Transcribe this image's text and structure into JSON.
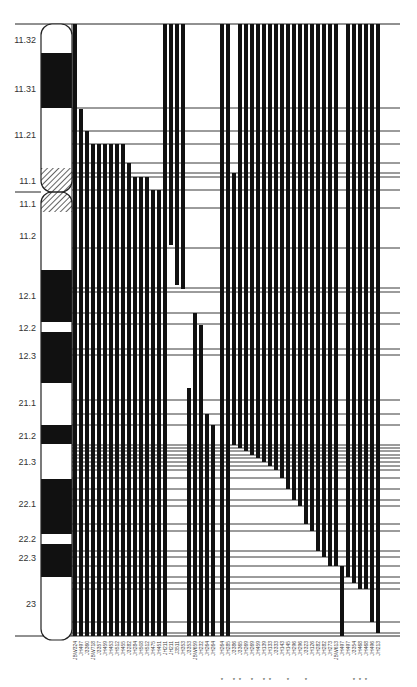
{
  "figure": {
    "title": "",
    "ideogram": {
      "x": 41,
      "width": 31,
      "top": 24,
      "bottom": 640,
      "centromere_y": 192,
      "bands": [
        {
          "label": "11.32",
          "y0": 24,
          "y1": 53,
          "type": "white"
        },
        {
          "label": "11.31",
          "y0": 53,
          "y1": 108,
          "type": "black"
        },
        {
          "label": "11.21",
          "y0": 108,
          "y1": 168,
          "type": "white"
        },
        {
          "label": "11.1",
          "y0": 168,
          "y1": 192,
          "type": "hatched"
        },
        {
          "label": "11.1",
          "y0": 192,
          "y1": 212,
          "type": "hatched"
        },
        {
          "label": "11.2",
          "y0": 212,
          "y1": 270,
          "type": "white"
        },
        {
          "label": "12.1",
          "y0": 270,
          "y1": 322,
          "type": "black"
        },
        {
          "label": "12.2",
          "y0": 322,
          "y1": 332,
          "type": "white"
        },
        {
          "label": "12.3",
          "y0": 332,
          "y1": 383,
          "type": "black"
        },
        {
          "label": "21.1",
          "y0": 383,
          "y1": 425,
          "type": "white"
        },
        {
          "label": "21.2",
          "y0": 425,
          "y1": 444,
          "type": "black"
        },
        {
          "label": "21.3",
          "y0": 444,
          "y1": 479,
          "type": "white"
        },
        {
          "label": "22.1",
          "y0": 479,
          "y1": 534,
          "type": "black"
        },
        {
          "label": "22.2",
          "y0": 534,
          "y1": 544,
          "type": "white"
        },
        {
          "label": "22.3",
          "y0": 544,
          "y1": 577,
          "type": "black"
        },
        {
          "label": "23",
          "y0": 577,
          "y1": 640,
          "type": "white"
        }
      ],
      "label_positions": [
        {
          "label": "11.32",
          "y": 40
        },
        {
          "label": "11.31",
          "y": 89
        },
        {
          "label": "11.21",
          "y": 135
        },
        {
          "label": "11.1",
          "y": 181
        },
        {
          "label": "11.1",
          "y": 204
        },
        {
          "label": "11.2",
          "y": 236
        },
        {
          "label": "12.1",
          "y": 296
        },
        {
          "label": "12.2",
          "y": 328
        },
        {
          "label": "12.3",
          "y": 356
        },
        {
          "label": "21.1",
          "y": 403
        },
        {
          "label": "21.2",
          "y": 436
        },
        {
          "label": "21.3",
          "y": 462
        },
        {
          "label": "22.1",
          "y": 504
        },
        {
          "label": "22.2",
          "y": 539
        },
        {
          "label": "22.3",
          "y": 558
        },
        {
          "label": "23",
          "y": 604
        }
      ]
    },
    "grid": {
      "x_start": 72,
      "x_end": 400,
      "top": 24,
      "bottom": 636,
      "top_line_x0": 15,
      "bottom_line_x0": 15,
      "horizontal_lines": [
        108,
        131,
        144,
        163,
        173,
        177,
        190,
        208,
        248,
        288,
        292,
        313,
        324,
        349,
        355,
        400,
        414,
        425,
        445,
        448,
        451,
        455,
        458,
        462,
        466,
        470,
        478,
        489,
        500,
        506,
        524,
        531,
        551,
        557,
        566,
        577,
        583,
        589,
        622,
        633
      ]
    },
    "chart_data": {
      "type": "deletion-map",
      "xlabel": "",
      "ylabel": "",
      "columns": [
        {
          "name": "JBW324",
          "x": 75,
          "y0": 24,
          "y1": 636,
          "star": false
        },
        {
          "name": "JH497",
          "x": 81,
          "y0": 109,
          "y1": 636,
          "star": false
        },
        {
          "name": "J3360",
          "x": 87,
          "y0": 131,
          "y1": 636,
          "star": false
        },
        {
          "name": "JBW718",
          "x": 93,
          "y0": 144,
          "y1": 636,
          "star": false
        },
        {
          "name": "J3357",
          "x": 99,
          "y0": 144,
          "y1": 636,
          "star": false
        },
        {
          "name": "JH459",
          "x": 105,
          "y0": 144,
          "y1": 636,
          "star": false
        },
        {
          "name": "JH453",
          "x": 111,
          "y0": 144,
          "y1": 636,
          "star": false
        },
        {
          "name": "JH512",
          "x": 117,
          "y0": 144,
          "y1": 636,
          "star": false
        },
        {
          "name": "JH455",
          "x": 123,
          "y0": 144,
          "y1": 636,
          "star": false
        },
        {
          "name": "J3282",
          "x": 129,
          "y0": 163,
          "y1": 636,
          "star": false
        },
        {
          "name": "JH284",
          "x": 135,
          "y0": 177,
          "y1": 636,
          "star": false
        },
        {
          "name": "JH508",
          "x": 141,
          "y0": 177,
          "y1": 636,
          "star": false
        },
        {
          "name": "JH512",
          "x": 147,
          "y0": 177,
          "y1": 636,
          "star": false
        },
        {
          "name": "JH475",
          "x": 153,
          "y0": 190,
          "y1": 636,
          "star": false
        },
        {
          "name": "JH451",
          "x": 159,
          "y0": 190,
          "y1": 636,
          "star": false
        },
        {
          "name": "JH211",
          "x": 165,
          "y0": 24,
          "y1": 636,
          "star": false
        },
        {
          "name": "JH211",
          "x": 171,
          "y0": 24,
          "y1": 245,
          "star": false
        },
        {
          "name": "J3511",
          "x": 177,
          "y0": 24,
          "y1": 285,
          "star": false
        },
        {
          "name": "JH353",
          "x": 183,
          "y0": 24,
          "y1": 289,
          "star": false
        },
        {
          "name": "J3353",
          "x": 189,
          "y0": 388,
          "y1": 636,
          "star": false
        },
        {
          "name": "JBW659",
          "x": 195,
          "y0": 313,
          "y1": 636,
          "star": false
        },
        {
          "name": "JH232",
          "x": 201,
          "y0": 325,
          "y1": 636,
          "star": false
        },
        {
          "name": "JH264",
          "x": 207,
          "y0": 414,
          "y1": 636,
          "star": false
        },
        {
          "name": "JH264",
          "x": 213,
          "y0": 425,
          "y1": 636,
          "star": false
        },
        {
          "name": "JH264",
          "x": 222,
          "y0": 24,
          "y1": 636,
          "star": true
        },
        {
          "name": "JH285",
          "x": 228,
          "y0": 24,
          "y1": 636,
          "star": false
        },
        {
          "name": "J3386",
          "x": 234,
          "y0": 173,
          "y1": 445,
          "star": true
        },
        {
          "name": "J3365",
          "x": 240,
          "y0": 24,
          "y1": 448,
          "star": true
        },
        {
          "name": "JH269",
          "x": 246,
          "y0": 24,
          "y1": 451,
          "star": false
        },
        {
          "name": "JH269",
          "x": 252,
          "y0": 24,
          "y1": 455,
          "star": true
        },
        {
          "name": "JH459",
          "x": 258,
          "y0": 24,
          "y1": 458,
          "star": false
        },
        {
          "name": "JH139",
          "x": 264,
          "y0": 24,
          "y1": 462,
          "star": true
        },
        {
          "name": "JH133",
          "x": 270,
          "y0": 24,
          "y1": 466,
          "star": true
        },
        {
          "name": "J3333",
          "x": 276,
          "y0": 24,
          "y1": 470,
          "star": false
        },
        {
          "name": "JH143",
          "x": 282,
          "y0": 24,
          "y1": 478,
          "star": false
        },
        {
          "name": "JH145",
          "x": 288,
          "y0": 24,
          "y1": 489,
          "star": true
        },
        {
          "name": "JH296",
          "x": 294,
          "y0": 24,
          "y1": 500,
          "star": false
        },
        {
          "name": "JH296",
          "x": 300,
          "y0": 24,
          "y1": 506,
          "star": false
        },
        {
          "name": "J3323",
          "x": 306,
          "y0": 24,
          "y1": 524,
          "star": true
        },
        {
          "name": "JH126",
          "x": 312,
          "y0": 24,
          "y1": 531,
          "star": false
        },
        {
          "name": "JH282",
          "x": 318,
          "y0": 24,
          "y1": 551,
          "star": false
        },
        {
          "name": "JH282",
          "x": 324,
          "y0": 24,
          "y1": 557,
          "star": false
        },
        {
          "name": "JH273",
          "x": 330,
          "y0": 24,
          "y1": 566,
          "star": false
        },
        {
          "name": "JBW613",
          "x": 336,
          "y0": 24,
          "y1": 566,
          "star": false
        },
        {
          "name": "JH497",
          "x": 342,
          "y0": 566,
          "y1": 636,
          "star": false
        },
        {
          "name": "JH497",
          "x": 348,
          "y0": 24,
          "y1": 577,
          "star": false
        },
        {
          "name": "J3354",
          "x": 354,
          "y0": 24,
          "y1": 583,
          "star": true
        },
        {
          "name": "JH468",
          "x": 360,
          "y0": 24,
          "y1": 589,
          "star": true
        },
        {
          "name": "JH468",
          "x": 366,
          "y0": 24,
          "y1": 589,
          "star": true
        },
        {
          "name": "JH496",
          "x": 372,
          "y0": 24,
          "y1": 622,
          "star": false
        },
        {
          "name": "JH213",
          "x": 378,
          "y0": 24,
          "y1": 633,
          "star": false
        }
      ]
    },
    "colors": {
      "bar": "#111111",
      "line": "#222222",
      "background": "#ffffff",
      "text": "#333333"
    }
  }
}
